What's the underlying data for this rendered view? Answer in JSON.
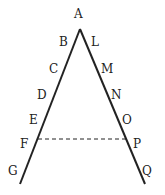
{
  "diagram": {
    "apex": {
      "label": "A",
      "x": 80,
      "y": 14
    },
    "left_labels": [
      {
        "label": "B",
        "x": 61,
        "y": 46
      },
      {
        "label": "C",
        "x": 50,
        "y": 73
      },
      {
        "label": "D",
        "x": 38,
        "y": 99
      },
      {
        "label": "E",
        "x": 31,
        "y": 124
      },
      {
        "label": "F",
        "x": 20,
        "y": 147
      },
      {
        "label": "G",
        "x": 8,
        "y": 174
      }
    ],
    "right_labels": [
      {
        "label": "L",
        "x": 92,
        "y": 46
      },
      {
        "label": "M",
        "x": 102,
        "y": 73
      },
      {
        "label": "N",
        "x": 112,
        "y": 99
      },
      {
        "label": "O",
        "x": 123,
        "y": 124
      },
      {
        "label": "P",
        "x": 133,
        "y": 147
      },
      {
        "label": "Q",
        "x": 143,
        "y": 174
      }
    ],
    "dashed_line": {
      "from": "F",
      "to": "P"
    }
  }
}
